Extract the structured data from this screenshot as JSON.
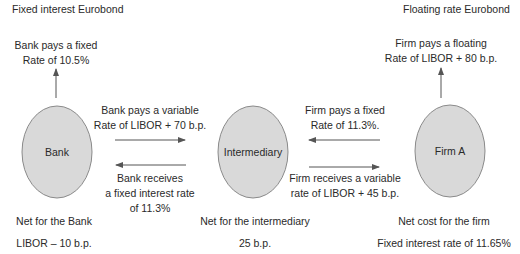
{
  "diagram": {
    "title_left": "Fixed interest Eurobond",
    "title_right": "Floating rate Eurobond",
    "colors": {
      "ellipse_fill": "#d9d9d9",
      "ellipse_stroke": "#8a8a8a",
      "arrow": "#555555",
      "text": "#2a2a2a"
    },
    "nodes": {
      "bank": {
        "label": "Bank"
      },
      "intermediary": {
        "label": "Intermediary"
      },
      "firm": {
        "label": "Firm A"
      }
    },
    "flows": {
      "bank_eurobond": {
        "line1": "Bank pays a fixed",
        "line2": "Rate of 10.5%"
      },
      "firm_eurobond": {
        "line1": "Firm pays a floating",
        "line2": "Rate of LIBOR + 80 b.p."
      },
      "bank_to_intermediary": {
        "line1": "Bank pays a variable",
        "line2": "Rate of LIBOR + 70 b.p."
      },
      "intermediary_to_bank": {
        "line1": "Bank receives",
        "line2": "a fixed interest rate",
        "line3": "of 11.3%"
      },
      "firm_to_intermediary": {
        "line1": "Firm pays a fixed",
        "line2": "Rate of 11.3%."
      },
      "intermediary_to_firm": {
        "line1": "Firm receives a variable",
        "line2": "rate of LIBOR + 45 b.p."
      }
    },
    "net_results": {
      "bank": {
        "label": "Net for the Bank",
        "value": "LIBOR – 10 b.p."
      },
      "intermediary": {
        "label": "Net for the intermediary",
        "value": "25 b.p."
      },
      "firm": {
        "label": "Net cost for the firm",
        "value": "Fixed interest rate of 11.65%"
      }
    }
  }
}
